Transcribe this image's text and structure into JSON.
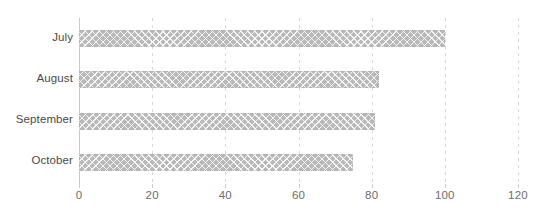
{
  "chart_data": {
    "type": "bar",
    "orientation": "horizontal",
    "title": "",
    "subtitle": "",
    "xlabel": "",
    "ylabel": "",
    "categories": [
      "July",
      "August",
      "September",
      "October"
    ],
    "values": [
      100,
      82,
      81,
      75
    ],
    "series": [
      {
        "name": "",
        "values": [
          100,
          82,
          81,
          75
        ]
      }
    ],
    "xlim": [
      0,
      120
    ],
    "xticks": [
      0,
      20,
      40,
      60,
      80,
      100,
      120
    ],
    "xtick_labels": [
      "0",
      "20",
      "40",
      "60",
      "80",
      "100",
      "120"
    ],
    "grid": "vertical-dashed",
    "legend": "none",
    "annotations": [],
    "colors": {
      "bar_fill": "#b9b9b9",
      "bar_pattern": "crosshatch",
      "gridline": "#d8d8d8",
      "axis_line": "#c9c9c9",
      "tick_label": "#6d6d6d",
      "category_label": "#4a4a4a",
      "background": "#ffffff"
    }
  }
}
